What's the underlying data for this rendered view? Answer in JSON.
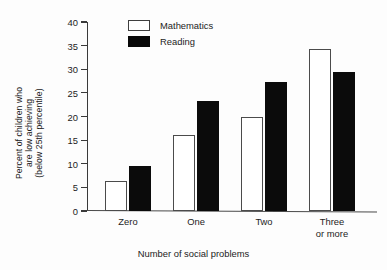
{
  "chart_data": {
    "type": "bar",
    "title": "",
    "subtitle": "",
    "categories": [
      "Zero",
      "One",
      "Two",
      "Three or more"
    ],
    "category_lines": [
      [
        "Zero"
      ],
      [
        "One"
      ],
      [
        "Two"
      ],
      [
        "Three",
        "or more"
      ]
    ],
    "series": [
      {
        "name": "Mathematics",
        "color": "#ffffff",
        "edge_color": "#4b4b4b",
        "values": [
          6.3,
          16.0,
          20.0,
          34.2
        ]
      },
      {
        "name": "Reading",
        "color": "#0b0b0b",
        "edge_color": "#0b0b0b",
        "values": [
          9.5,
          23.2,
          27.2,
          29.5
        ]
      }
    ],
    "xlabel": "Number of social problems",
    "ylabel": "Percent of children who are low achieving (below 25th percentile)",
    "ylabel_lines": [
      "Percent of children who",
      "are low achieving",
      "(below 25th percentile)"
    ],
    "ylim": [
      0,
      40
    ],
    "yticks": [
      0,
      5,
      10,
      15,
      20,
      25,
      30,
      35,
      40
    ],
    "ytick_labels": [
      "0",
      "5",
      "10",
      "15",
      "20",
      "25",
      "30",
      "35",
      "40"
    ],
    "grid": false,
    "legend_position": "top-left-inside",
    "legend_entries": [
      "Mathematics",
      "Reading"
    ]
  }
}
